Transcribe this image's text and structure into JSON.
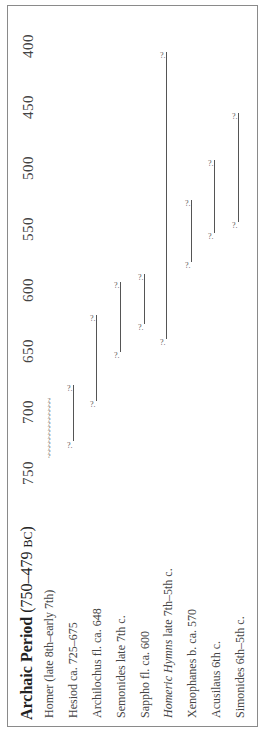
{
  "chart_data": {
    "type": "timeline",
    "orientation": "rotated-90",
    "title": "Archaic Period (750–479 BC)",
    "title_bold": "Archaic Period",
    "title_range": "(750–479 ",
    "title_era": "BC",
    "title_close": ")",
    "axis": {
      "label": "",
      "ticks": [
        "750",
        "700",
        "650",
        "600",
        "550",
        "500",
        "450",
        "400"
      ],
      "range": [
        750,
        400
      ]
    },
    "rows": [
      {
        "label": "Homer (late 8th–early 7th)",
        "start": 741,
        "end": 689,
        "style": "uncertain-dots"
      },
      {
        "label": "Hesiod ca. 725–675",
        "start": 725,
        "end": 679,
        "style": "bar"
      },
      {
        "label": "Archilochus fl. ca. 648",
        "start": 692,
        "end": 621,
        "style": "bar"
      },
      {
        "label": "Semonides late 7th c.",
        "start": 652,
        "end": 594,
        "style": "bar"
      },
      {
        "label": "Sappho fl. ca. 600",
        "start": 629,
        "end": 588,
        "style": "bar"
      },
      {
        "label_italic": "Homeric Hymns",
        "label": " late 7th–5th c.",
        "start": 641,
        "end": 406,
        "style": "bar"
      },
      {
        "label": "Xenophanes b. ca. 570",
        "start": 578,
        "end": 527,
        "style": "bar"
      },
      {
        "label": "Acusilaus 6th c.",
        "start": 554,
        "end": 494,
        "style": "bar"
      },
      {
        "label": "Simonides 6th–5th c.",
        "start": 545,
        "end": 456,
        "style": "bar"
      }
    ],
    "cap_glyph": "?",
    "grid": false
  }
}
